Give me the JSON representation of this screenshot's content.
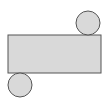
{
  "diagram": {
    "type": "cylinder-net",
    "colors": {
      "fill": "#d9d9d9",
      "stroke": "#555555",
      "background": "#ffffff"
    },
    "rectangle": {
      "x": 8,
      "y": 35,
      "width": 93,
      "height": 38
    },
    "top_circle": {
      "cx": 88,
      "cy": 23,
      "r": 12
    },
    "bottom_circle": {
      "cx": 20,
      "cy": 85,
      "r": 12
    }
  }
}
